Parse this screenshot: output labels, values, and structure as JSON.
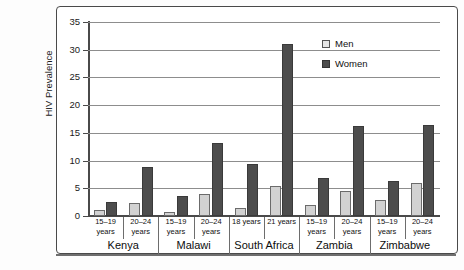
{
  "chart_data": {
    "type": "bar",
    "title": "",
    "xlabel": "",
    "ylabel": "HIV Prevalence",
    "ylim": [
      0,
      35
    ],
    "ytick_step": 5,
    "yticks": [
      35,
      30,
      25,
      20,
      15,
      10,
      5,
      0
    ],
    "grid": true,
    "legend_position": "upper-right",
    "legend": [
      "Men",
      "Women"
    ],
    "groups": [
      {
        "country": "Kenya",
        "age": "15–19\nyears",
        "age_line1": "15–19",
        "age_line2": "years",
        "men": 1.0,
        "women": 2.6
      },
      {
        "country": "Kenya",
        "age": "20–24\nyears",
        "age_line1": "20–24",
        "age_line2": "years",
        "men": 2.3,
        "women": 8.9
      },
      {
        "country": "Malawi",
        "age": "15–19\nyears",
        "age_line1": "15–19",
        "age_line2": "years",
        "men": 0.7,
        "women": 3.7
      },
      {
        "country": "Malawi",
        "age": "20–24\nyears",
        "age_line1": "20–24",
        "age_line2": "years",
        "men": 4.0,
        "women": 13.2
      },
      {
        "country": "South Africa",
        "age": "18 years",
        "age_line1": "18 years",
        "age_line2": "",
        "men": 1.5,
        "women": 9.4
      },
      {
        "country": "South Africa",
        "age": "21 years",
        "age_line1": "21 years",
        "age_line2": "",
        "men": 5.5,
        "women": 31.0
      },
      {
        "country": "Zambia",
        "age": "15–19\nyears",
        "age_line1": "15–19",
        "age_line2": "years",
        "men": 2.0,
        "women": 6.8
      },
      {
        "country": "Zambia",
        "age": "20–24\nyears",
        "age_line1": "20–24",
        "age_line2": "years",
        "men": 4.6,
        "women": 16.2
      },
      {
        "country": "Zimbabwe",
        "age": "15–19\nyears",
        "age_line1": "15–19",
        "age_line2": "years",
        "men": 2.9,
        "women": 6.4
      },
      {
        "country": "Zimbabwe",
        "age": "20–24\nyears",
        "age_line1": "20–24",
        "age_line2": "years",
        "men": 6.0,
        "women": 16.4
      }
    ],
    "categories": [
      "Kenya 15–19 years",
      "Kenya 20–24 years",
      "Malawi 15–19 years",
      "Malawi 20–24 years",
      "South Africa 18 years",
      "South Africa 21 years",
      "Zambia 15–19 years",
      "Zambia 20–24 years",
      "Zimbabwe 15–19 years",
      "Zimbabwe 20–24 years"
    ],
    "series": [
      {
        "name": "Men",
        "color": "#d2d2d2",
        "values": [
          1.0,
          2.3,
          0.7,
          4.0,
          1.5,
          5.5,
          2.0,
          4.6,
          2.9,
          6.0
        ]
      },
      {
        "name": "Women",
        "color": "#4d4d4d",
        "values": [
          2.6,
          8.9,
          3.7,
          13.2,
          9.4,
          31.0,
          6.8,
          16.2,
          6.4,
          16.4
        ]
      }
    ],
    "countries": [
      "Kenya",
      "Malawi",
      "South Africa",
      "Zambia",
      "Zimbabwe"
    ]
  }
}
